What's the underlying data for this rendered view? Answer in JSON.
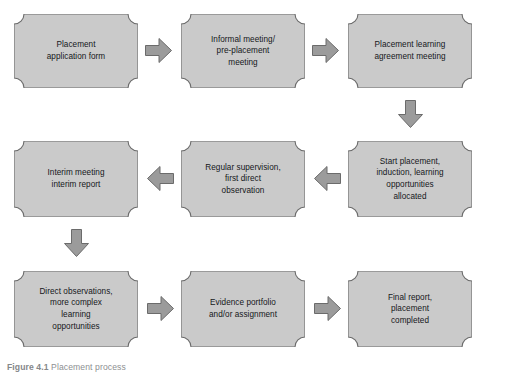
{
  "figure": {
    "background_color": "#ffffff",
    "box_fill_color": "#cacaca",
    "box_border_color": "#6b6b6b",
    "arrow_fill_color": "#9b9b9b",
    "arrow_border_color": "#6b6b6b",
    "text_color": "#15171a",
    "caption_label": "Figure 4.1",
    "caption_text": "Placement process"
  },
  "nodes": [
    {
      "id": "placement-application-form",
      "label": "Placement\napplication form",
      "row": 1,
      "column": 1
    },
    {
      "id": "informal-pre-placement-meeting",
      "label": "Informal meeting/\npre-placement\nmeeting",
      "row": 1,
      "column": 2
    },
    {
      "id": "placement-learning-agreement-meeting",
      "label": "Placement learning\nagreement meeting",
      "row": 1,
      "column": 3
    },
    {
      "id": "interim-meeting-interim-report",
      "label": "Interim meeting\ninterim report",
      "row": 2,
      "column": 1
    },
    {
      "id": "regular-supervision-first-direct-observation",
      "label": "Regular supervision,\nfirst direct\nobservation",
      "row": 2,
      "column": 2
    },
    {
      "id": "start-placement-induction",
      "label": "Start placement,\ninduction, learning\nopportunities\nallocated",
      "row": 2,
      "column": 3
    },
    {
      "id": "direct-observations-more-complex",
      "label": "Direct observations,\nmore complex\nlearning\nopportunities",
      "row": 3,
      "column": 1
    },
    {
      "id": "evidence-portfolio-assignment",
      "label": "Evidence portfolio\nand/or assignment",
      "row": 3,
      "column": 2
    },
    {
      "id": "final-report-placement-completed",
      "label": "Final report,\nplacement\ncompleted",
      "row": 3,
      "column": 3
    }
  ],
  "connectors": [
    {
      "id": "arrow-1",
      "from": "placement-application-form",
      "to": "informal-pre-placement-meeting",
      "direction": "right"
    },
    {
      "id": "arrow-2",
      "from": "informal-pre-placement-meeting",
      "to": "placement-learning-agreement-meeting",
      "direction": "right"
    },
    {
      "id": "arrow-3",
      "from": "placement-learning-agreement-meeting",
      "to": "start-placement-induction",
      "direction": "down"
    },
    {
      "id": "arrow-4",
      "from": "start-placement-induction",
      "to": "regular-supervision-first-direct-observation",
      "direction": "left"
    },
    {
      "id": "arrow-5",
      "from": "regular-supervision-first-direct-observation",
      "to": "interim-meeting-interim-report",
      "direction": "left"
    },
    {
      "id": "arrow-6",
      "from": "interim-meeting-interim-report",
      "to": "direct-observations-more-complex",
      "direction": "down"
    },
    {
      "id": "arrow-7",
      "from": "direct-observations-more-complex",
      "to": "evidence-portfolio-assignment",
      "direction": "right"
    },
    {
      "id": "arrow-8",
      "from": "evidence-portfolio-assignment",
      "to": "final-report-placement-completed",
      "direction": "right"
    }
  ]
}
